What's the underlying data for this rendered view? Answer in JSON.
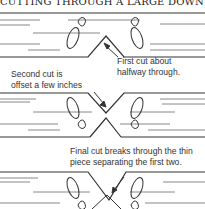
{
  "title": "CUTTING THROUGH A LARGE DOWN LOG",
  "panels": [
    {
      "label_line1": "First cut about",
      "label_line2": "halfway through."
    },
    {
      "label_line1": "Second cut is",
      "label_line2": "offset a few inches"
    },
    {
      "label_line1": "Final cut breaks through the thin",
      "label_line2": "piece separating the first two."
    }
  ],
  "colors": {
    "line": "#333333",
    "text": "#333333"
  }
}
